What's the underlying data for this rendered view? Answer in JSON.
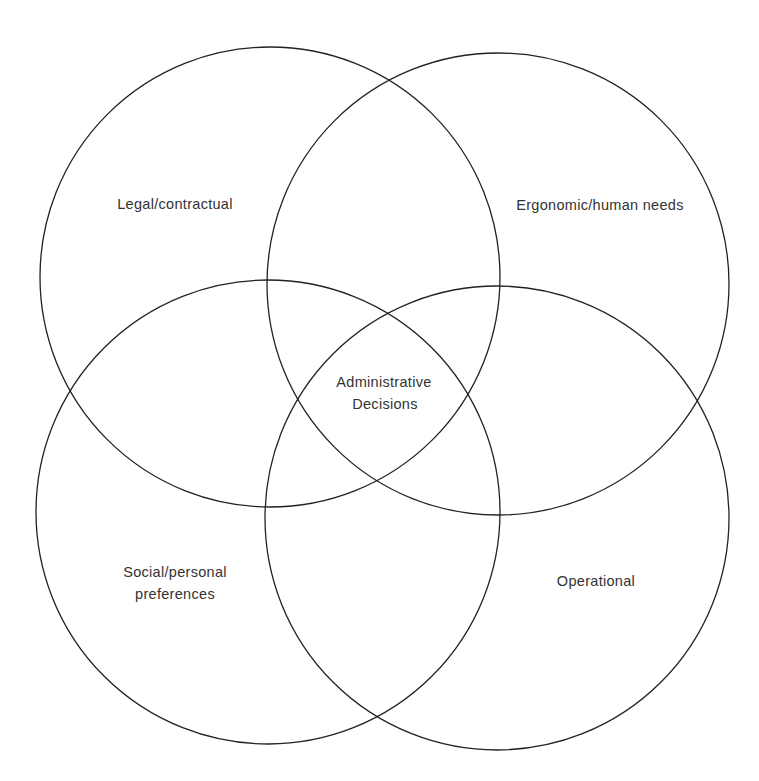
{
  "diagram": {
    "type": "venn",
    "circles": [
      {
        "id": "legal",
        "label_lines": [
          "Legal/contractual"
        ],
        "cx": 270,
        "cy": 277,
        "r": 230
      },
      {
        "id": "ergonomic",
        "label_lines": [
          "Ergonomic/human needs"
        ],
        "cx": 498,
        "cy": 284,
        "r": 231
      },
      {
        "id": "social",
        "label_lines": [
          "Social/personal",
          "preferences"
        ],
        "cx": 268,
        "cy": 512,
        "r": 232
      },
      {
        "id": "operational",
        "label_lines": [
          "Operational"
        ],
        "cx": 497,
        "cy": 518,
        "r": 232
      }
    ],
    "center": {
      "label_lines": [
        "Administrative",
        "Decisions"
      ]
    },
    "stroke_color": "#222222",
    "text_color": "#333333"
  }
}
